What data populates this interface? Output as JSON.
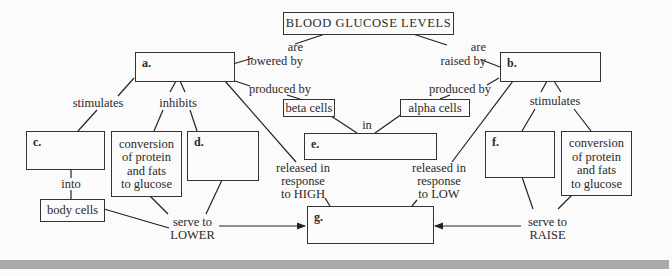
{
  "title": "BLOOD GLUCOSE LEVELS",
  "boxes": {
    "a": {
      "letter": "a."
    },
    "b": {
      "letter": "b."
    },
    "c": {
      "letter": "c."
    },
    "d": {
      "letter": "d."
    },
    "e": {
      "letter": "e."
    },
    "f": {
      "letter": "f."
    },
    "g": {
      "letter": "g."
    },
    "beta_cells": "beta cells",
    "alpha_cells": "alpha cells",
    "body_cells": "body cells",
    "conversion_left": "conversion\nof protein\nand fats\nto glucose",
    "conversion_right": "conversion\nof protein\nand fats\nto glucose"
  },
  "labels": {
    "are_lowered_by": "are\nlowered by",
    "are_raised_by": "are\nraised by",
    "produced_by_left": "produced by",
    "produced_by_right": "produced by",
    "stimulates_left": "stimulates",
    "inhibits": "inhibits",
    "stimulates_right": "stimulates",
    "in": "in",
    "into": "into",
    "released_high": "released in\nresponse\nto HIGH",
    "released_low": "released in\nresponse\nto LOW",
    "serve_to_lower": "serve to\nLOWER",
    "serve_to_raise": "serve to\nRAISE"
  }
}
